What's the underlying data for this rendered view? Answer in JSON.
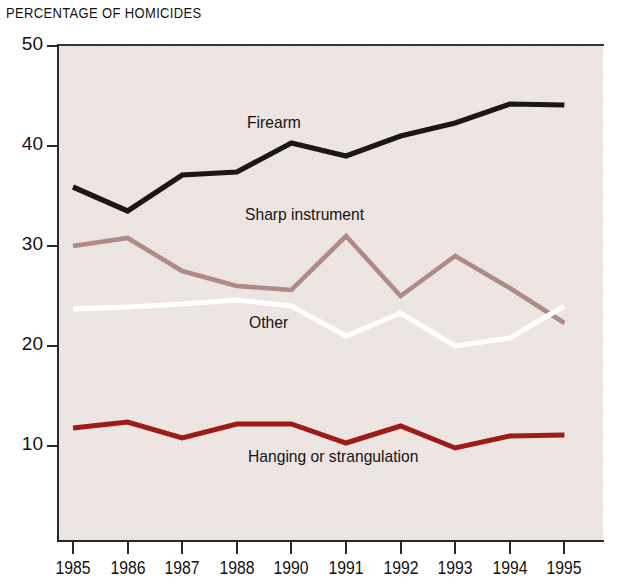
{
  "chart_data": {
    "type": "line",
    "title": "PERCENTAGE OF HOMICIDES",
    "xlabel": "",
    "ylabel": "",
    "x": [
      "1985",
      "1986",
      "1987",
      "1988",
      "1990",
      "1991",
      "1992",
      "1993",
      "1994",
      "1995"
    ],
    "categories": [
      "1985",
      "1986",
      "1987",
      "1988",
      "1990",
      "1991",
      "1992",
      "1993",
      "1994",
      "1995"
    ],
    "ylim": [
      0,
      50
    ],
    "yticks": [
      10,
      20,
      30,
      40,
      50
    ],
    "ytick_labels": [
      "10",
      "20",
      "30",
      "40",
      "50"
    ],
    "grid": false,
    "legend": "inline-labels",
    "background": "#ece4e1",
    "series": [
      {
        "name": "Firearm",
        "color": "#1c1715",
        "values": [
          35.9,
          33.5,
          37.1,
          37.4,
          40.3,
          39.0,
          41.0,
          42.3,
          44.2,
          44.1
        ]
      },
      {
        "name": "Sharp instrument",
        "color": "#b08a86",
        "values": [
          30.0,
          30.8,
          27.5,
          26.0,
          25.6,
          31.0,
          25.0,
          29.0,
          25.8,
          22.3
        ]
      },
      {
        "name": "Other",
        "color": "#ffffff",
        "values": [
          23.7,
          23.9,
          24.2,
          24.6,
          24.0,
          21.0,
          23.3,
          20.0,
          20.8,
          24.0
        ]
      },
      {
        "name": "Hanging or strangulation",
        "color": "#9e1b18",
        "values": [
          11.8,
          12.4,
          10.8,
          12.2,
          12.2,
          10.3,
          12.0,
          9.8,
          11.0,
          11.1
        ]
      }
    ]
  },
  "labels": {
    "firearm": "Firearm",
    "sharp_instrument": "Sharp instrument",
    "other": "Other",
    "hanging": "Hanging or strangulation"
  }
}
